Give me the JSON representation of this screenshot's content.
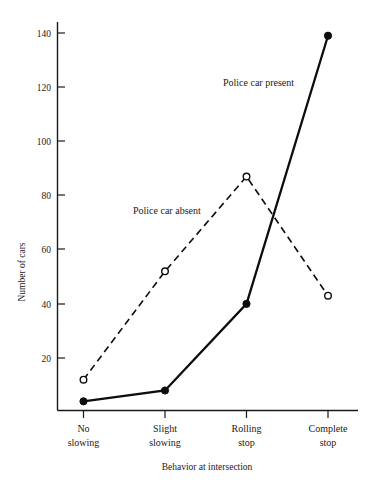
{
  "chart_data": {
    "type": "line",
    "title": "",
    "xlabel": "Behavior at intersection",
    "ylabel": "Number of cars",
    "categories": [
      "No slowing",
      "Slight slowing",
      "Rolling stop",
      "Complete stop"
    ],
    "category_lines": [
      [
        "No",
        "slowing"
      ],
      [
        "Slight",
        "slowing"
      ],
      [
        "Rolling",
        "stop"
      ],
      [
        "Complete",
        "stop"
      ]
    ],
    "series": [
      {
        "name": "Police car present",
        "values": [
          4,
          8,
          40,
          139
        ],
        "marker": "filled-circle",
        "linestyle": "solid",
        "color": "#0d0d0d"
      },
      {
        "name": "Police car absent",
        "values": [
          12,
          52,
          87,
          43
        ],
        "marker": "open-circle",
        "linestyle": "dashed",
        "color": "#0d0d0d"
      }
    ],
    "annotations": [
      {
        "text": "Police car present",
        "x": 223,
        "y": 86
      },
      {
        "text": "Police car absent",
        "x": 133,
        "y": 214
      }
    ],
    "yticks": [
      20,
      40,
      60,
      80,
      100,
      120,
      140
    ],
    "ytick_labels": [
      "20",
      "40",
      "60",
      "80",
      "100",
      "120",
      "140"
    ],
    "ylim": [
      -1,
      148
    ],
    "grid": false,
    "legend": "inline-annotations"
  },
  "colors": {
    "ink": "#1a1a1a",
    "line": "#0d0d0d",
    "background": "#ffffff"
  }
}
